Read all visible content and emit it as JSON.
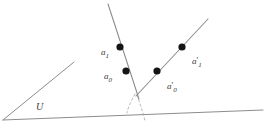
{
  "figure": {
    "background_color": "#ffffff",
    "line_color": "#8c8c8c",
    "dashed_color": "#b0a8a8",
    "dot_color": "#151515",
    "label_color": "#3a3a3a",
    "width": 266,
    "height": 128
  },
  "plane": {
    "name": "U",
    "label": "U",
    "label_x": 36,
    "label_y": 101,
    "edges": [
      {
        "name": "plane-left-edge",
        "x1": 3,
        "y1": 120,
        "x2": 74,
        "y2": 62
      },
      {
        "name": "plane-bottom-edge",
        "x1": 3,
        "y1": 120,
        "x2": 263,
        "y2": 110
      }
    ]
  },
  "lines": [
    {
      "name": "left-line",
      "x1": 108,
      "y1": 4,
      "x2": 139,
      "y2": 99
    },
    {
      "name": "right-line",
      "x1": 136,
      "y1": 96,
      "x2": 208,
      "y2": 19
    }
  ],
  "dashed_curves": [
    {
      "name": "dashed-left-branch",
      "path": "M 135 94 C 130 103, 128 108, 127 113"
    },
    {
      "name": "dashed-right-branch",
      "path": "M 137 95 C 140 104, 143 112, 145 121"
    }
  ],
  "points": [
    {
      "name": "point-a1",
      "label_base": "a",
      "label_prime": "",
      "label_sub": "1",
      "cx": 120,
      "cy": 47,
      "r": 3.6,
      "label_x": 101,
      "label_y": 42
    },
    {
      "name": "point-a0",
      "label_base": "a",
      "label_prime": "",
      "label_sub": "0",
      "cx": 126,
      "cy": 71,
      "r": 3.6,
      "label_x": 104,
      "label_y": 66
    },
    {
      "name": "point-a0-prime",
      "label_base": "a",
      "label_prime": "'",
      "label_sub": "0",
      "cx": 157,
      "cy": 71,
      "r": 3.6,
      "label_x": 167,
      "label_y": 76
    },
    {
      "name": "point-a1-prime",
      "label_base": "a",
      "label_prime": "'",
      "label_sub": "1",
      "cx": 182,
      "cy": 47,
      "r": 3.6,
      "label_x": 192,
      "label_y": 51
    }
  ]
}
